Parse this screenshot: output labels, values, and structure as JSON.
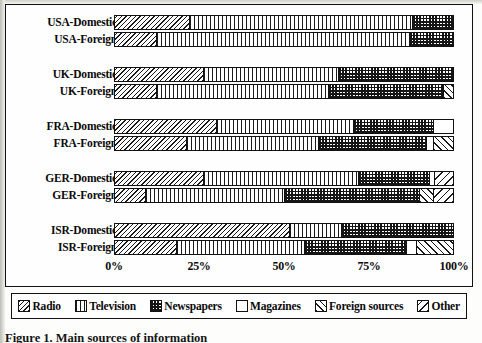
{
  "figure": {
    "caption": "Figure 1. Main sources of information",
    "frame_color": "#111111",
    "background": "#fefefe"
  },
  "legend": {
    "items": [
      {
        "label": "Radio",
        "pattern": "diagonal-hatch-dense",
        "key": "radio"
      },
      {
        "label": "Television",
        "pattern": "vertical-lines",
        "key": "television"
      },
      {
        "label": "Newspapers",
        "pattern": "checkerboard",
        "key": "newspapers"
      },
      {
        "label": "Magazines",
        "pattern": "solid-white",
        "key": "magazines"
      },
      {
        "label": "Foreign sources",
        "pattern": "diagonal-hatch-right",
        "key": "foreign"
      },
      {
        "label": "Other",
        "pattern": "diagonal-hatch-sparse",
        "key": "other"
      }
    ]
  },
  "axis": {
    "ticks": [
      "0%",
      "25%",
      "50%",
      "75%",
      "100%"
    ],
    "tick_values": [
      0,
      25,
      50,
      75,
      100
    ],
    "min": 0,
    "max": 100
  },
  "chart_data": {
    "type": "bar",
    "orientation": "horizontal",
    "stacked": true,
    "normalized_percent": true,
    "title": "",
    "xlabel": "",
    "ylabel": "",
    "xlim": [
      0,
      100
    ],
    "grid": false,
    "legend_position": "bottom",
    "categories": [
      "USA-Domestic",
      "USA-Foreign",
      "UK-Domestic",
      "UK-Foreign",
      "FRA-Domestic",
      "FRA-Foreign",
      "GER-Domestic",
      "GER-Foreign",
      "ISR-Domestic",
      "ISR-Foreign"
    ],
    "series": [
      {
        "name": "Radio",
        "values": [
          22,
          12,
          26,
          12,
          30,
          21,
          26,
          9,
          51.5,
          18
        ]
      },
      {
        "name": "Television",
        "values": [
          66,
          75,
          40,
          51,
          40.5,
          39,
          46,
          41,
          15.5,
          38
        ]
      },
      {
        "name": "Newspapers",
        "values": [
          12,
          13,
          34,
          34,
          23.5,
          32,
          21,
          40,
          33,
          30
        ]
      },
      {
        "name": "Magazines",
        "values": [
          0,
          0,
          0,
          0,
          6,
          2,
          1.5,
          0,
          0,
          3
        ]
      },
      {
        "name": "Foreign sources",
        "values": [
          0,
          0,
          0,
          3,
          0,
          6,
          0,
          4,
          0,
          11
        ]
      },
      {
        "name": "Other",
        "values": [
          0,
          0,
          0,
          0,
          0,
          0,
          5.5,
          6,
          0,
          0
        ]
      }
    ],
    "groups": [
      {
        "group": "USA",
        "rows": [
          {
            "label": "USA-Domestic",
            "segments": [
              {
                "key": "radio",
                "value": 22
              },
              {
                "key": "television",
                "value": 66
              },
              {
                "key": "newspapers",
                "value": 12
              }
            ]
          },
          {
            "label": "USA-Foreign",
            "segments": [
              {
                "key": "radio",
                "value": 12
              },
              {
                "key": "television",
                "value": 75
              },
              {
                "key": "newspapers",
                "value": 13
              }
            ]
          }
        ]
      },
      {
        "group": "UK",
        "rows": [
          {
            "label": "UK-Domestic",
            "segments": [
              {
                "key": "radio",
                "value": 26
              },
              {
                "key": "television",
                "value": 40
              },
              {
                "key": "newspapers",
                "value": 34
              }
            ]
          },
          {
            "label": "UK-Foreign",
            "segments": [
              {
                "key": "radio",
                "value": 12
              },
              {
                "key": "television",
                "value": 51
              },
              {
                "key": "newspapers",
                "value": 34
              },
              {
                "key": "foreign",
                "value": 3
              }
            ]
          }
        ]
      },
      {
        "group": "FRA",
        "rows": [
          {
            "label": "FRA-Domestic",
            "segments": [
              {
                "key": "radio",
                "value": 30
              },
              {
                "key": "television",
                "value": 40.5
              },
              {
                "key": "newspapers",
                "value": 23.5
              },
              {
                "key": "magazines",
                "value": 6
              }
            ]
          },
          {
            "label": "FRA-Foreign",
            "segments": [
              {
                "key": "radio",
                "value": 21
              },
              {
                "key": "television",
                "value": 39
              },
              {
                "key": "newspapers",
                "value": 32
              },
              {
                "key": "magazines",
                "value": 2
              },
              {
                "key": "foreign",
                "value": 6
              }
            ]
          }
        ]
      },
      {
        "group": "GER",
        "rows": [
          {
            "label": "GER-Domestic",
            "segments": [
              {
                "key": "radio",
                "value": 26
              },
              {
                "key": "television",
                "value": 46
              },
              {
                "key": "newspapers",
                "value": 21
              },
              {
                "key": "magazines",
                "value": 1.5
              },
              {
                "key": "other",
                "value": 5.5
              }
            ]
          },
          {
            "label": "GER-Foreign",
            "segments": [
              {
                "key": "radio",
                "value": 9
              },
              {
                "key": "television",
                "value": 41
              },
              {
                "key": "newspapers",
                "value": 40
              },
              {
                "key": "foreign",
                "value": 4
              },
              {
                "key": "other",
                "value": 6
              }
            ]
          }
        ]
      },
      {
        "group": "ISR",
        "rows": [
          {
            "label": "ISR-Domestic",
            "segments": [
              {
                "key": "radio",
                "value": 51.5
              },
              {
                "key": "television",
                "value": 15.5
              },
              {
                "key": "newspapers",
                "value": 33
              }
            ]
          },
          {
            "label": "ISR-Foreign",
            "segments": [
              {
                "key": "radio",
                "value": 18
              },
              {
                "key": "television",
                "value": 38
              },
              {
                "key": "newspapers",
                "value": 30
              },
              {
                "key": "magazines",
                "value": 3
              },
              {
                "key": "foreign",
                "value": 11
              }
            ]
          }
        ]
      }
    ]
  }
}
